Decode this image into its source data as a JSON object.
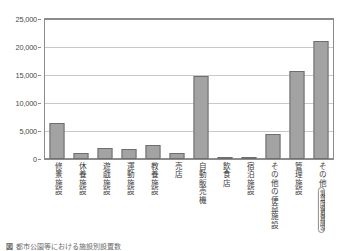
{
  "chart_data": {
    "type": "bar",
    "title": "",
    "xlabel": "",
    "ylabel": "",
    "ylim": [
      0,
      25000
    ],
    "ytick_values": [
      0,
      5000,
      10000,
      15000,
      20000,
      25000
    ],
    "ytick_labels": [
      "0",
      "5,000",
      "10,000",
      "15,000",
      "20,000",
      "25,000"
    ],
    "grid": true,
    "legend": "none",
    "bar_color": "#a3a3a3",
    "bar_edge_color": "#6e6e6e",
    "axis_color": "#8c8c8c",
    "grid_color": "#c9c9c9",
    "categories": [
      "修景施設",
      "休養施設",
      "遊戯施設",
      "運動施設",
      "教養施設",
      "売店",
      "自動販売機",
      "飲食店",
      "宿泊施設",
      "その他の便益施設",
      "管理施設",
      "その他"
    ],
    "values": [
      6500,
      1000,
      2000,
      1800,
      2500,
      1100,
      14800,
      400,
      200,
      4400,
      15700,
      21000
    ],
    "annotations": [
      {
        "category": "その他",
        "note": "集会所・備蓄倉庫等",
        "note_columns": [
          "集会所",
          "備蓄倉庫等"
        ]
      }
    ]
  },
  "caption": {
    "tag": "図",
    "text": "都市公園等における施設別設置数"
  }
}
